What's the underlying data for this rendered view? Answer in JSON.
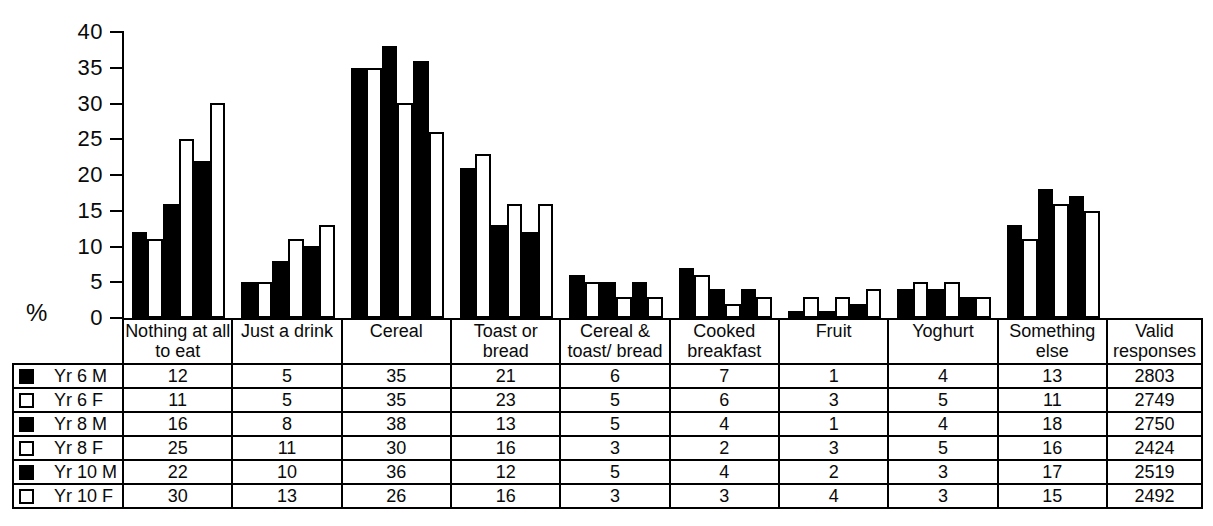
{
  "figure": {
    "background": "#ffffff",
    "ink": "#000000",
    "bar_filled_color": "#000000",
    "bar_open_color": "#ffffff"
  },
  "chart_data": {
    "type": "bar",
    "title": "",
    "xlabel": "",
    "ylabel": "%",
    "ylim": [
      0,
      40
    ],
    "yticks": [
      40,
      35,
      30,
      25,
      20,
      15,
      10,
      5,
      0
    ],
    "grid": false,
    "legend_position": "table-row-labels",
    "categories": [
      "Nothing at all to eat",
      "Just a drink",
      "Cereal",
      "Toast or bread",
      "Cereal & toast/ bread",
      "Cooked breakfast",
      "Fruit",
      "Yoghurt",
      "Something else"
    ],
    "series": [
      {
        "name": "Yr 6 M",
        "fill": "filled",
        "values": [
          12,
          5,
          35,
          21,
          6,
          7,
          1,
          4,
          13
        ],
        "valid_responses": "2803"
      },
      {
        "name": "Yr 6 F",
        "fill": "open",
        "values": [
          11,
          5,
          35,
          23,
          5,
          6,
          3,
          5,
          11
        ],
        "valid_responses": "2749"
      },
      {
        "name": "Yr 8 M",
        "fill": "filled",
        "values": [
          16,
          8,
          38,
          13,
          5,
          4,
          1,
          4,
          18
        ],
        "valid_responses": "2750"
      },
      {
        "name": "Yr 8 F",
        "fill": "open",
        "values": [
          25,
          11,
          30,
          16,
          3,
          2,
          3,
          5,
          16
        ],
        "valid_responses": "2424"
      },
      {
        "name": "Yr 10 M",
        "fill": "filled",
        "values": [
          22,
          10,
          36,
          12,
          5,
          4,
          2,
          3,
          17
        ],
        "valid_responses": "2519"
      },
      {
        "name": "Yr 10 F",
        "fill": "open",
        "values": [
          30,
          13,
          26,
          16,
          3,
          3,
          4,
          3,
          15
        ],
        "valid_responses": "2492"
      }
    ]
  },
  "table": {
    "col_headers": [
      [
        "Nothing at all",
        "to eat"
      ],
      [
        "Just a drink"
      ],
      [
        "Cereal"
      ],
      [
        "Toast or",
        "bread"
      ],
      [
        "Cereal &",
        "toast/ bread"
      ],
      [
        "Cooked",
        "breakfast"
      ],
      [
        "Fruit"
      ],
      [
        "Yoghurt"
      ],
      [
        "Something",
        "else"
      ],
      [
        "Valid",
        "responses"
      ]
    ]
  }
}
